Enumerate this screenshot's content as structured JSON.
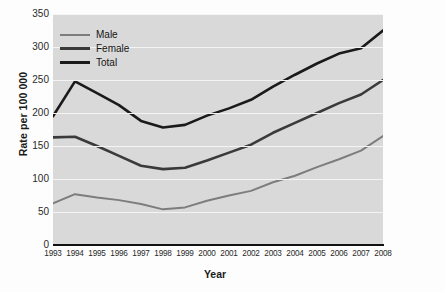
{
  "figure": {
    "axis_title_x": "Year",
    "axis_title_y": "Rate per 100 000",
    "source_note": "SOURCE: © All rights reserved. Figure 1 from Report on Sexually Transmitted Infections in Canada 2008. Adapted and reproduced with permission from the Minister of Health, 2015. Retrieved July 28, 2015, from http://www.phac-aspc.gc.ca/std-mts/report/sti-its2008/index-eng.php.",
    "colors": {
      "plot_background": "#d9d9d9",
      "gridline": "#f4f4f4",
      "axis": "#111111",
      "male": "#7d7d7d",
      "female": "#3a3a3a",
      "total": "#1a1a1a"
    }
  },
  "chart_data": {
    "type": "line",
    "title": "",
    "xlabel": "Year",
    "ylabel": "Rate per 100 000",
    "grid": true,
    "legend_position": "top-left",
    "xlim": [
      1993,
      2008
    ],
    "ylim": [
      0,
      350
    ],
    "ytick_values": [
      0,
      50,
      100,
      150,
      200,
      250,
      300,
      350
    ],
    "ytick_labels": [
      "0",
      "50",
      "100",
      "150",
      "200",
      "250",
      "300",
      "350"
    ],
    "categories": [
      1993,
      1994,
      1995,
      1996,
      1997,
      1998,
      1999,
      2000,
      2001,
      2002,
      2003,
      2004,
      2005,
      2006,
      2007,
      2008
    ],
    "xtick_labels": [
      "1993",
      "1994",
      "1995",
      "1996",
      "1997",
      "1998",
      "1999",
      "2000",
      "2001",
      "2002",
      "2003",
      "2004",
      "2005",
      "2006",
      "2007",
      "2008"
    ],
    "series": [
      {
        "name": "Male",
        "color": "#7d7d7d",
        "values": [
          63,
          77,
          72,
          68,
          62,
          54,
          57,
          67,
          75,
          82,
          95,
          105,
          118,
          130,
          143,
          165
        ]
      },
      {
        "name": "Female",
        "color": "#3a3a3a",
        "values": [
          163,
          164,
          150,
          135,
          120,
          115,
          117,
          128,
          140,
          152,
          170,
          185,
          200,
          215,
          228,
          250
        ]
      },
      {
        "name": "Total",
        "color": "#1a1a1a",
        "values": [
          195,
          248,
          230,
          212,
          188,
          178,
          182,
          196,
          207,
          220,
          240,
          258,
          275,
          290,
          298,
          325
        ]
      }
    ]
  }
}
